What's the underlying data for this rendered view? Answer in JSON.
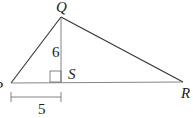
{
  "diagram": {
    "type": "triangle-with-altitude",
    "vertices": {
      "P": {
        "label": "P",
        "x": 11,
        "y": 83
      },
      "Q": {
        "label": "Q",
        "x": 61,
        "y": 17
      },
      "R": {
        "label": "R",
        "x": 183,
        "y": 82
      },
      "S": {
        "label": "S",
        "x": 61,
        "y": 82
      }
    },
    "altitude": {
      "from": "Q",
      "to": "S",
      "length_label": "6"
    },
    "right_angle_marker": "S",
    "dimension": {
      "from": "P",
      "to": "S",
      "length_label": "5"
    },
    "colors": {
      "line": "#333333",
      "text": "#222222",
      "background": "#ffffff"
    }
  }
}
